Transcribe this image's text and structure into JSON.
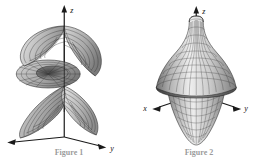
{
  "figure": {
    "background_color": "#ffffff",
    "ink_color": "#1a1a1a",
    "mesh_color": "#2b2b2b",
    "shade_light": "#f2f2f2",
    "shade_mid": "#b8b8b8",
    "shade_dark": "#6e6e6e",
    "panels": [
      {
        "id": "left",
        "name": "spiral-ramp-surface",
        "surface_type": "helicoid",
        "description": "Spiral ramp (helicoid) winding around the vertical axis",
        "axes": [
          {
            "name": "z",
            "label": "z",
            "direction": "up"
          },
          {
            "name": "y",
            "label": "y",
            "direction": "lower-right"
          },
          {
            "name": "x",
            "label": "",
            "direction": "lower-left"
          }
        ],
        "caption": "Figure 1"
      },
      {
        "id": "right",
        "name": "bell-surface-of-revolution",
        "surface_type": "surface-of-revolution",
        "description": "Flared bell / spindle shaped surface of revolution about the vertical axis",
        "axes": [
          {
            "name": "z",
            "label": "z",
            "direction": "up"
          },
          {
            "name": "x",
            "label": "x",
            "direction": "lower-left"
          },
          {
            "name": "y",
            "label": "y",
            "direction": "lower-right"
          }
        ],
        "caption": "Figure 2"
      }
    ]
  }
}
